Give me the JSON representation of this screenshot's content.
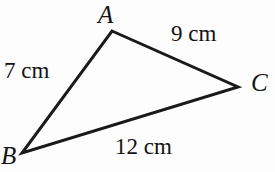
{
  "figure": {
    "type": "triangle-diagram",
    "background_color": "#fdfdfd",
    "stroke_color": "#1a1a1a",
    "stroke_width": 3
  },
  "vertices": {
    "a": {
      "label": "A",
      "x": 112,
      "y": 31
    },
    "b": {
      "label": "B",
      "x": 22,
      "y": 153
    },
    "c": {
      "label": "C",
      "x": 238,
      "y": 87
    }
  },
  "sides": {
    "ab": {
      "label": "7 cm",
      "length": 7,
      "unit": "cm"
    },
    "ac": {
      "label": "9 cm",
      "length": 9,
      "unit": "cm"
    },
    "bc": {
      "label": "12 cm",
      "length": 12,
      "unit": "cm"
    }
  }
}
